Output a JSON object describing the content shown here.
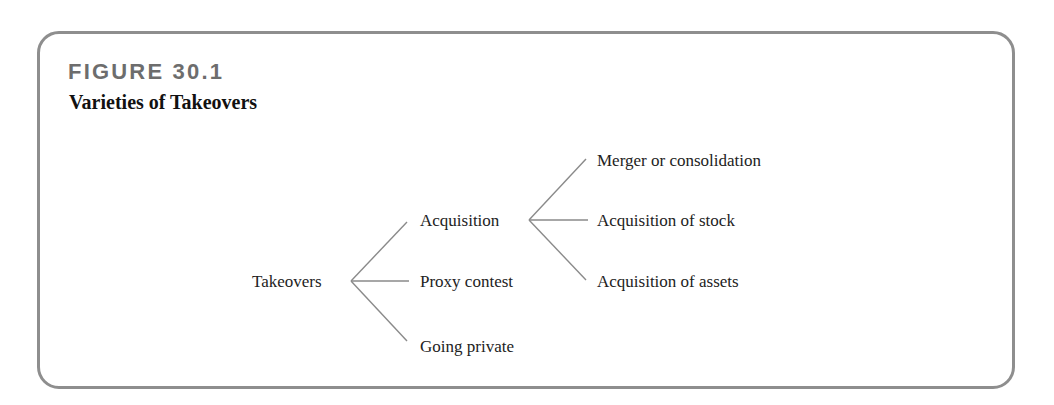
{
  "figure": {
    "number": "FIGURE 30.1",
    "title": "Varieties of Takeovers"
  },
  "tree": {
    "root": "Takeovers",
    "children": [
      {
        "label": "Acquisition",
        "children": [
          {
            "label": "Merger or consolidation"
          },
          {
            "label": "Acquisition of stock"
          },
          {
            "label": "Acquisition of assets"
          }
        ]
      },
      {
        "label": "Proxy contest"
      },
      {
        "label": "Going private"
      }
    ]
  },
  "colors": {
    "frame_border": "#8e8e8e",
    "figure_number": "#6d6d6d",
    "connector": "#8a8a8a"
  }
}
